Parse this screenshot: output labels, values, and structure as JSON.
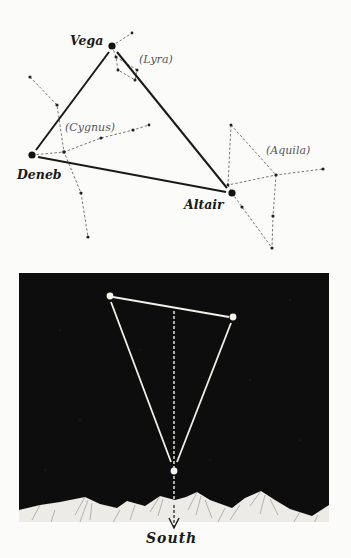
{
  "top_diagram": {
    "stars": {
      "vega": {
        "label": "Vega",
        "x": 112,
        "y": 46
      },
      "deneb": {
        "label": "Deneb",
        "x": 32,
        "y": 155
      },
      "altair": {
        "label": "Altair",
        "x": 232,
        "y": 193
      }
    },
    "constellations": {
      "lyra": {
        "label": "(Lyra)"
      },
      "cygnus": {
        "label": "(Cygnus)"
      },
      "aquila": {
        "label": "(Aquila)"
      }
    }
  },
  "bottom_diagram": {
    "direction_label": "South",
    "colors": {
      "sky": "#0d0d0d",
      "lines": "#f2f0e8",
      "mountains": "#ecebe6"
    }
  }
}
